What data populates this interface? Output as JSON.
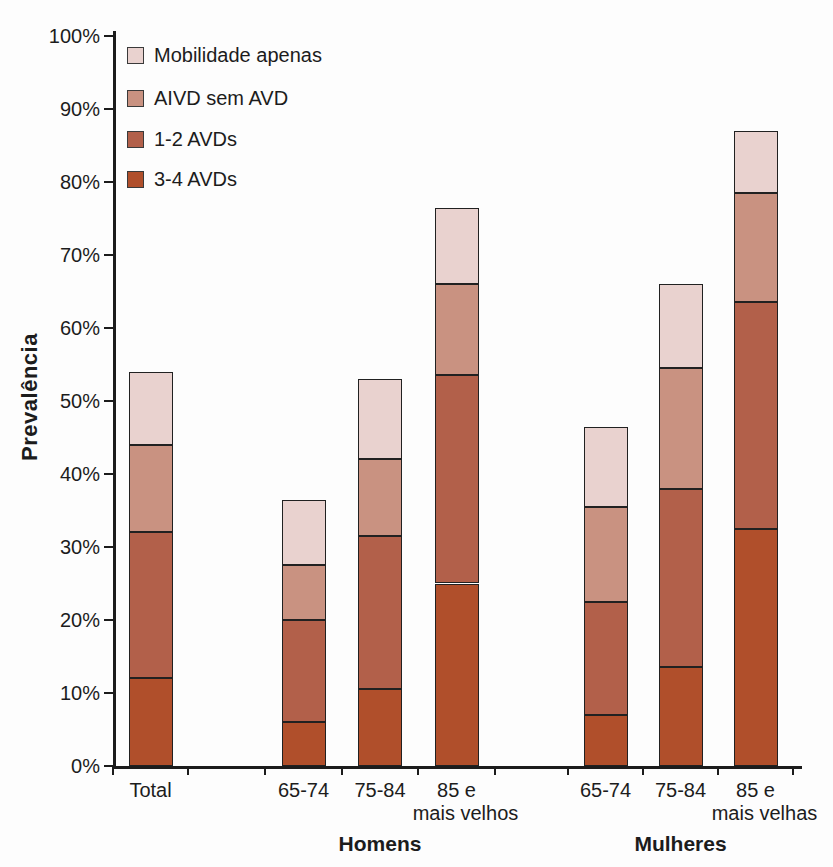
{
  "chart_data": {
    "type": "bar",
    "stacked": true,
    "title": "",
    "xlabel": "",
    "ylabel": "Prevalência",
    "ylim": [
      0,
      100
    ],
    "yticks": [
      "0%",
      "10%",
      "20%",
      "30%",
      "40%",
      "50%",
      "60%",
      "70%",
      "80%",
      "90%",
      "100%"
    ],
    "grid": false,
    "legend_position": "top-left-inside",
    "stack_order_note": "series listed bottom-to-top; values are percent per stacked segment",
    "series": [
      {
        "name": "3-4 AVDs",
        "color": "#b04f2b",
        "texture": false,
        "values": [
          12,
          6,
          10.5,
          25,
          7,
          13.5,
          32.5
        ]
      },
      {
        "name": "1-2 AVDs",
        "color": "#b2604a",
        "texture": true,
        "values": [
          20,
          14,
          21,
          28.5,
          15.5,
          24.5,
          31
        ]
      },
      {
        "name": "AIVD sem AVD",
        "color": "#c99281",
        "texture": false,
        "values": [
          12,
          7.5,
          10.5,
          12.5,
          13,
          16.5,
          15
        ]
      },
      {
        "name": "Mobilidade apenas",
        "color": "#e9d2cf",
        "texture": false,
        "values": [
          10,
          9,
          11,
          10.5,
          11,
          11.5,
          8.5
        ]
      }
    ],
    "stack_totals": [
      54,
      36.5,
      53,
      76.5,
      46.5,
      66,
      87
    ],
    "categories": [
      {
        "label": "Total",
        "label2": "",
        "group": ""
      },
      {
        "label": "65-74",
        "label2": "",
        "group": "Homens"
      },
      {
        "label": "75-84",
        "label2": "",
        "group": "Homens"
      },
      {
        "label": "85 e",
        "label2": "mais velhos",
        "group": "Homens"
      },
      {
        "label": "65-74",
        "label2": "",
        "group": "Mulheres"
      },
      {
        "label": "75-84",
        "label2": "",
        "group": "Mulheres"
      },
      {
        "label": "85 e",
        "label2": "mais velhas",
        "group": "Mulheres"
      }
    ],
    "group_labels": [
      "Homens",
      "Mulheres"
    ]
  },
  "legend": {
    "items": [
      {
        "label": "Mobilidade apenas",
        "color": "#e9d2cf",
        "texture": false
      },
      {
        "label": "AIVD sem AVD",
        "color": "#c99281",
        "texture": false
      },
      {
        "label": "1-2 AVDs",
        "color": "#b2604a",
        "texture": true
      },
      {
        "label": "3-4 AVDs",
        "color": "#b04f2b",
        "texture": false
      }
    ]
  },
  "colors": {
    "axis": "#1c1c1c",
    "text": "#1c1c1c",
    "background": "#fdfdfd"
  }
}
